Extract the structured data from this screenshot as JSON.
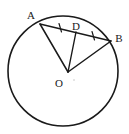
{
  "figure": {
    "type": "geometry-diagram",
    "background_color": "#ffffff",
    "stroke_color": "#1a1a1a",
    "circle": {
      "name": "circle-o",
      "center_x": 63,
      "center_y": 71,
      "radius": 55,
      "stroke_width": 1.6,
      "fill": "none"
    },
    "points": [
      {
        "id": "A",
        "label": "A",
        "x": 40,
        "y": 24,
        "label_x": 31,
        "label_y": 19
      },
      {
        "id": "D",
        "label": "D",
        "x": 76,
        "y": 32,
        "label_x": 74,
        "label_y": 30
      },
      {
        "id": "B",
        "label": "B",
        "x": 111,
        "y": 41,
        "label_x": 116,
        "label_y": 41
      },
      {
        "id": "O",
        "label": "O",
        "x": 68,
        "y": 72,
        "label_x": 58,
        "label_y": 86
      }
    ],
    "segments": [
      {
        "id": "AB",
        "from": "A",
        "to": "B",
        "x1": 40,
        "y1": 24,
        "x2": 111,
        "y2": 41,
        "stroke_width": 1.3
      },
      {
        "id": "OA",
        "from": "O",
        "to": "A",
        "x1": 68,
        "y1": 72,
        "x2": 40,
        "y2": 24,
        "stroke_width": 1.5
      },
      {
        "id": "OD",
        "from": "O",
        "to": "D",
        "x1": 68,
        "y1": 72,
        "x2": 76,
        "y2": 32,
        "stroke_width": 1.3
      },
      {
        "id": "OB",
        "from": "O",
        "to": "B",
        "x1": 68,
        "y1": 72,
        "x2": 111,
        "y2": 41,
        "stroke_width": 1.5
      }
    ],
    "tick_marks": [
      {
        "id": "tick-AD",
        "on_segment": "AD",
        "x": 60,
        "y": 28,
        "angle": 75,
        "length": 8
      },
      {
        "id": "tick-DB",
        "on_segment": "DB",
        "x": 93,
        "y": 36,
        "angle": 75,
        "length": 8
      }
    ],
    "center_dot": {
      "x": 74,
      "y": 80,
      "r": 0.7
    }
  }
}
